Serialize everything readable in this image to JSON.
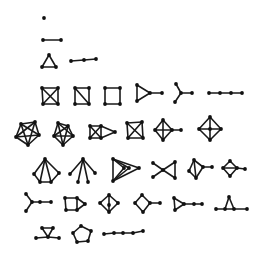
{
  "colors": {
    "background": "#ffffff",
    "ink": "#1a1a1a",
    "node": "#111111"
  },
  "node_radius": 1.9,
  "graphs": [
    {
      "id": "g1",
      "row": 0,
      "name": "single-vertex",
      "nodes": [
        [
          44,
          18
        ]
      ],
      "edges": []
    },
    {
      "id": "g2",
      "row": 1,
      "name": "edge",
      "nodes": [
        [
          43,
          40
        ],
        [
          61,
          40
        ]
      ],
      "edges": [
        [
          0,
          1
        ]
      ]
    },
    {
      "id": "g3",
      "row": 2,
      "name": "triangle",
      "nodes": [
        [
          49,
          55
        ],
        [
          42,
          67
        ],
        [
          56,
          67
        ]
      ],
      "edges": [
        [
          0,
          1
        ],
        [
          1,
          2
        ],
        [
          2,
          0
        ]
      ]
    },
    {
      "id": "g4",
      "row": 2,
      "name": "path-3",
      "nodes": [
        [
          71,
          61
        ],
        [
          84,
          60
        ],
        [
          96,
          59
        ]
      ],
      "edges": [
        [
          0,
          1
        ],
        [
          1,
          2
        ]
      ]
    },
    {
      "id": "g5",
      "row": 3,
      "name": "k4",
      "nodes": [
        [
          42,
          88
        ],
        [
          58,
          88
        ],
        [
          58,
          104
        ],
        [
          43,
          104
        ]
      ],
      "edges": [
        [
          0,
          1
        ],
        [
          1,
          2
        ],
        [
          2,
          3
        ],
        [
          3,
          0
        ],
        [
          0,
          2
        ],
        [
          1,
          3
        ]
      ]
    },
    {
      "id": "g6",
      "row": 3,
      "name": "diamond-square",
      "nodes": [
        [
          75,
          88
        ],
        [
          89,
          88
        ],
        [
          89,
          104
        ],
        [
          75,
          104
        ]
      ],
      "edges": [
        [
          0,
          1
        ],
        [
          1,
          2
        ],
        [
          2,
          3
        ],
        [
          3,
          0
        ],
        [
          0,
          2
        ]
      ]
    },
    {
      "id": "g7",
      "row": 3,
      "name": "cycle-4",
      "nodes": [
        [
          105,
          88
        ],
        [
          120,
          88
        ],
        [
          120,
          104
        ],
        [
          105,
          104
        ]
      ],
      "edges": [
        [
          0,
          1
        ],
        [
          1,
          2
        ],
        [
          2,
          3
        ],
        [
          3,
          0
        ]
      ]
    },
    {
      "id": "g8",
      "row": 3,
      "name": "triangle-pendant",
      "nodes": [
        [
          137,
          85
        ],
        [
          137,
          101
        ],
        [
          150,
          93
        ],
        [
          162,
          93
        ]
      ],
      "edges": [
        [
          0,
          1
        ],
        [
          1,
          2
        ],
        [
          2,
          0
        ],
        [
          2,
          3
        ]
      ]
    },
    {
      "id": "g9",
      "row": 3,
      "name": "claw-tail",
      "nodes": [
        [
          176,
          84
        ],
        [
          181,
          93
        ],
        [
          175,
          102
        ],
        [
          192,
          93
        ]
      ],
      "edges": [
        [
          0,
          1
        ],
        [
          2,
          1
        ],
        [
          1,
          3
        ]
      ]
    },
    {
      "id": "g10",
      "row": 3,
      "name": "path-4",
      "nodes": [
        [
          209,
          93
        ],
        [
          220,
          93
        ],
        [
          231,
          93
        ],
        [
          242,
          93
        ]
      ],
      "edges": [
        [
          0,
          1
        ],
        [
          1,
          2
        ],
        [
          2,
          3
        ]
      ]
    },
    {
      "id": "g11",
      "row": 4,
      "name": "k5",
      "nodes": [
        [
          21,
          124
        ],
        [
          35,
          122
        ],
        [
          39,
          135
        ],
        [
          28,
          145
        ],
        [
          16,
          137
        ]
      ],
      "edges": [
        [
          0,
          1
        ],
        [
          1,
          2
        ],
        [
          2,
          3
        ],
        [
          3,
          4
        ],
        [
          4,
          0
        ],
        [
          0,
          2
        ],
        [
          0,
          3
        ],
        [
          1,
          3
        ],
        [
          1,
          4
        ],
        [
          2,
          4
        ]
      ]
    },
    {
      "id": "g12",
      "row": 4,
      "name": "k5-minus-edge",
      "nodes": [
        [
          58,
          123
        ],
        [
          68,
          126
        ],
        [
          73,
          136
        ],
        [
          63,
          145
        ],
        [
          54,
          136
        ]
      ],
      "edges": [
        [
          0,
          1
        ],
        [
          1,
          2
        ],
        [
          2,
          3
        ],
        [
          3,
          4
        ],
        [
          4,
          0
        ],
        [
          0,
          2
        ],
        [
          0,
          3
        ],
        [
          1,
          3
        ],
        [
          1,
          4
        ],
        [
          2,
          4
        ]
      ]
    },
    {
      "id": "g13",
      "row": 4,
      "name": "k4-triangle",
      "nodes": [
        [
          90,
          126
        ],
        [
          101,
          126
        ],
        [
          101,
          138
        ],
        [
          90,
          138
        ],
        [
          115,
          132
        ]
      ],
      "edges": [
        [
          0,
          1
        ],
        [
          1,
          2
        ],
        [
          2,
          3
        ],
        [
          3,
          0
        ],
        [
          0,
          2
        ],
        [
          1,
          3
        ],
        [
          1,
          4
        ],
        [
          2,
          4
        ]
      ]
    },
    {
      "id": "g14",
      "row": 4,
      "name": "k4-b",
      "nodes": [
        [
          127,
          123
        ],
        [
          142,
          122
        ],
        [
          143,
          138
        ],
        [
          128,
          138
        ]
      ],
      "edges": [
        [
          0,
          1
        ],
        [
          1,
          2
        ],
        [
          2,
          3
        ],
        [
          3,
          0
        ],
        [
          0,
          2
        ],
        [
          1,
          3
        ]
      ]
    },
    {
      "id": "g15",
      "row": 4,
      "name": "cross-diamond-pendant",
      "nodes": [
        [
          163,
          120
        ],
        [
          155,
          130
        ],
        [
          163,
          140
        ],
        [
          172,
          130
        ],
        [
          181,
          130
        ]
      ],
      "edges": [
        [
          0,
          1
        ],
        [
          1,
          2
        ],
        [
          2,
          3
        ],
        [
          3,
          0
        ],
        [
          0,
          2
        ],
        [
          1,
          3
        ],
        [
          3,
          4
        ]
      ]
    },
    {
      "id": "g16",
      "row": 4,
      "name": "wheel-4",
      "nodes": [
        [
          210,
          117
        ],
        [
          199,
          129
        ],
        [
          210,
          140
        ],
        [
          221,
          129
        ],
        [
          210,
          129
        ]
      ],
      "edges": [
        [
          0,
          1
        ],
        [
          1,
          2
        ],
        [
          2,
          3
        ],
        [
          3,
          0
        ],
        [
          0,
          2
        ],
        [
          1,
          4
        ],
        [
          4,
          3
        ]
      ]
    },
    {
      "id": "g17",
      "row": 5,
      "name": "fan",
      "nodes": [
        [
          45,
          159
        ],
        [
          34,
          174
        ],
        [
          40,
          182
        ],
        [
          51,
          182
        ],
        [
          59,
          173
        ]
      ],
      "edges": [
        [
          0,
          1
        ],
        [
          0,
          2
        ],
        [
          0,
          3
        ],
        [
          0,
          4
        ],
        [
          1,
          2
        ],
        [
          2,
          3
        ],
        [
          3,
          4
        ]
      ]
    },
    {
      "id": "g18",
      "row": 5,
      "name": "star-edge",
      "nodes": [
        [
          83,
          159
        ],
        [
          70,
          174
        ],
        [
          78,
          182
        ],
        [
          88,
          182
        ],
        [
          95,
          173
        ]
      ],
      "edges": [
        [
          0,
          1
        ],
        [
          0,
          2
        ],
        [
          0,
          3
        ],
        [
          0,
          4
        ]
      ]
    },
    {
      "id": "g19",
      "row": 5,
      "name": "nested-triangles",
      "nodes": [
        [
          113,
          159
        ],
        [
          113,
          181
        ],
        [
          139,
          168
        ],
        [
          124,
          168
        ],
        [
          129,
          168
        ]
      ],
      "edges": [
        [
          0,
          1
        ],
        [
          0,
          2
        ],
        [
          1,
          2
        ],
        [
          0,
          3
        ],
        [
          1,
          3
        ],
        [
          0,
          4
        ],
        [
          1,
          4
        ]
      ]
    },
    {
      "id": "g20",
      "row": 5,
      "name": "bowtie",
      "nodes": [
        [
          153,
          163
        ],
        [
          163,
          170
        ],
        [
          153,
          177
        ],
        [
          175,
          162
        ],
        [
          175,
          178
        ]
      ],
      "edges": [
        [
          0,
          1
        ],
        [
          1,
          2
        ],
        [
          1,
          3
        ],
        [
          1,
          4
        ],
        [
          3,
          4
        ]
      ]
    },
    {
      "id": "g21",
      "row": 5,
      "name": "kite-pendant",
      "nodes": [
        [
          194,
          160
        ],
        [
          189,
          171
        ],
        [
          196,
          178
        ],
        [
          203,
          167
        ],
        [
          212,
          167
        ]
      ],
      "edges": [
        [
          0,
          1
        ],
        [
          1,
          2
        ],
        [
          2,
          3
        ],
        [
          3,
          0
        ],
        [
          0,
          2
        ],
        [
          3,
          4
        ]
      ]
    },
    {
      "id": "g22",
      "row": 5,
      "name": "diamond-chord-pendant",
      "nodes": [
        [
          230,
          161
        ],
        [
          223,
          168
        ],
        [
          230,
          176
        ],
        [
          237,
          168
        ],
        [
          245,
          169
        ]
      ],
      "edges": [
        [
          0,
          1
        ],
        [
          1,
          2
        ],
        [
          2,
          3
        ],
        [
          3,
          0
        ],
        [
          1,
          3
        ],
        [
          3,
          4
        ]
      ]
    },
    {
      "id": "g23",
      "row": 6,
      "name": "claw-path",
      "nodes": [
        [
          26,
          194
        ],
        [
          32,
          202
        ],
        [
          26,
          211
        ],
        [
          40,
          202
        ],
        [
          51,
          202
        ]
      ],
      "edges": [
        [
          0,
          1
        ],
        [
          2,
          1
        ],
        [
          1,
          3
        ],
        [
          3,
          4
        ]
      ]
    },
    {
      "id": "g24",
      "row": 6,
      "name": "square-triangle",
      "nodes": [
        [
          65,
          198
        ],
        [
          77,
          198
        ],
        [
          77,
          210
        ],
        [
          66,
          210
        ],
        [
          85,
          204
        ]
      ],
      "edges": [
        [
          0,
          1
        ],
        [
          1,
          2
        ],
        [
          2,
          3
        ],
        [
          3,
          0
        ],
        [
          1,
          4
        ],
        [
          2,
          4
        ]
      ]
    },
    {
      "id": "g25",
      "row": 6,
      "name": "diamond-vertical",
      "nodes": [
        [
          109,
          195
        ],
        [
          100,
          203
        ],
        [
          109,
          212
        ],
        [
          118,
          203
        ],
        [
          109,
          205
        ]
      ],
      "edges": [
        [
          0,
          1
        ],
        [
          1,
          2
        ],
        [
          2,
          3
        ],
        [
          3,
          0
        ],
        [
          0,
          4
        ],
        [
          4,
          2
        ]
      ]
    },
    {
      "id": "g26",
      "row": 6,
      "name": "diamond-pendant",
      "nodes": [
        [
          142,
          195
        ],
        [
          135,
          203
        ],
        [
          143,
          212
        ],
        [
          150,
          203
        ],
        [
          160,
          203
        ]
      ],
      "edges": [
        [
          0,
          1
        ],
        [
          1,
          2
        ],
        [
          2,
          3
        ],
        [
          3,
          0
        ],
        [
          3,
          4
        ]
      ]
    },
    {
      "id": "g27",
      "row": 6,
      "name": "triangle-path",
      "nodes": [
        [
          174,
          198
        ],
        [
          175,
          210
        ],
        [
          184,
          204
        ],
        [
          194,
          204
        ],
        [
          202,
          204
        ]
      ],
      "edges": [
        [
          0,
          1
        ],
        [
          1,
          2
        ],
        [
          2,
          0
        ],
        [
          2,
          3
        ],
        [
          3,
          4
        ]
      ]
    },
    {
      "id": "g28",
      "row": 6,
      "name": "triangle-on-path",
      "nodes": [
        [
          229,
          197
        ],
        [
          216,
          209
        ],
        [
          225,
          209
        ],
        [
          234,
          209
        ],
        [
          247,
          209
        ]
      ],
      "edges": [
        [
          1,
          2
        ],
        [
          2,
          3
        ],
        [
          3,
          4
        ],
        [
          0,
          2
        ],
        [
          0,
          3
        ]
      ]
    },
    {
      "id": "g29",
      "row": 7,
      "name": "triangle-paw-path",
      "nodes": [
        [
          42,
          228
        ],
        [
          53,
          228
        ],
        [
          48,
          237
        ],
        [
          36,
          238
        ],
        [
          59,
          238
        ]
      ],
      "edges": [
        [
          0,
          1
        ],
        [
          1,
          2
        ],
        [
          2,
          0
        ],
        [
          3,
          2
        ],
        [
          2,
          4
        ]
      ]
    },
    {
      "id": "g30",
      "row": 7,
      "name": "cycle-5",
      "nodes": [
        [
          81,
          226
        ],
        [
          91,
          231
        ],
        [
          88,
          241
        ],
        [
          77,
          242
        ],
        [
          73,
          233
        ]
      ],
      "edges": [
        [
          0,
          1
        ],
        [
          1,
          2
        ],
        [
          2,
          3
        ],
        [
          3,
          4
        ],
        [
          4,
          0
        ]
      ]
    },
    {
      "id": "g31",
      "row": 7,
      "name": "path-5",
      "nodes": [
        [
          104,
          234
        ],
        [
          114,
          233
        ],
        [
          123,
          233
        ],
        [
          133,
          233
        ],
        [
          143,
          231
        ]
      ],
      "edges": [
        [
          0,
          1
        ],
        [
          1,
          2
        ],
        [
          2,
          3
        ],
        [
          3,
          4
        ]
      ]
    }
  ]
}
